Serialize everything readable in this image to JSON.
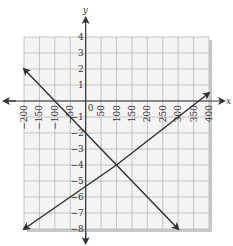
{
  "chart_data": {
    "type": "line",
    "title": "",
    "xlabel": "x",
    "ylabel": "y",
    "xlim": [
      -200,
      400
    ],
    "ylim": [
      -8,
      4
    ],
    "x_ticks": [
      -200,
      -150,
      -100,
      -50,
      0,
      50,
      100,
      150,
      200,
      250,
      300,
      350,
      400
    ],
    "x_tick_labels": [
      "-200",
      "-150",
      "-100",
      "-50",
      "0",
      "50",
      "100",
      "150",
      "200",
      "250",
      "300",
      "350",
      "400"
    ],
    "y_ticks": [
      4,
      3,
      2,
      1,
      -1,
      -2,
      -3,
      -4,
      -5,
      -6,
      -7,
      -8
    ],
    "y_tick_labels": [
      "4",
      "3",
      "2",
      "1",
      "-1",
      "-2",
      "-3",
      "-4",
      "-5",
      "-6",
      "-7",
      "-8"
    ],
    "grid": true,
    "series": [
      {
        "name": "line-decreasing",
        "equation": "y = -0.02x - 2",
        "points": [
          [
            -200,
            2
          ],
          [
            0,
            -2
          ],
          [
            100,
            -4
          ],
          [
            300,
            -8
          ]
        ],
        "color": "#333333"
      },
      {
        "name": "line-increasing",
        "equation": "y = 0.015x - 5.5",
        "points": [
          [
            -200,
            -8.5
          ],
          [
            0,
            -5.5
          ],
          [
            100,
            -4
          ],
          [
            400,
            0.5
          ]
        ],
        "color": "#333333"
      }
    ],
    "intersection": [
      100,
      -4
    ]
  },
  "labels": {
    "x_axis": "x",
    "y_axis": "y",
    "origin": "0"
  }
}
